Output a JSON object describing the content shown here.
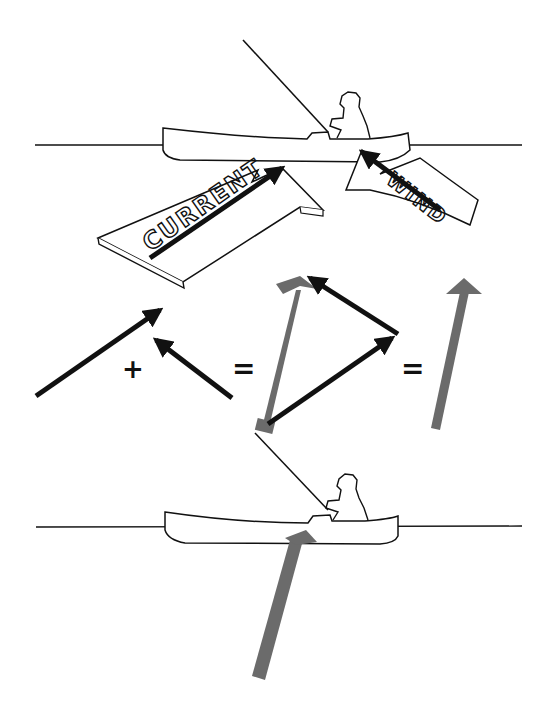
{
  "diagram": {
    "top_scene": {
      "current_label": "CURRENT",
      "wind_label": "WIND"
    },
    "equation": {
      "plus": "+",
      "equals_1": "=",
      "equals_2": "="
    },
    "colors": {
      "ink": "#111111",
      "resultant": "#6b6b6b",
      "background": "#ffffff"
    }
  }
}
